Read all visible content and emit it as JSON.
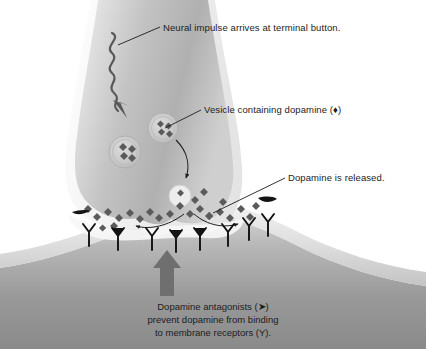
{
  "figure": {
    "background_color": "#ffffff",
    "ink_color": "#1c1c1c"
  },
  "labels": {
    "impulse": "Neural impulse arrives at terminal button.",
    "vesicle": "Vesicle containing dopamine (♦)",
    "released": "Dopamine is released."
  },
  "caption": {
    "line1": "Dopamine antagonists (➤)",
    "line2": "prevent dopamine from binding",
    "line3": "to membrane receptors (Υ)."
  },
  "symbols": {
    "dopamine": "♦",
    "antagonist": "➤",
    "receptor": "Υ"
  },
  "structures": {
    "terminal_button": "presynaptic-terminal-button",
    "axon": "axon-shaft",
    "postsynaptic_cell": "postsynaptic-membrane-cell",
    "synaptic_cleft": "synaptic-cleft",
    "vesicle_count": 2,
    "vesicle_dopamine_each": 4,
    "receptor_count": 8,
    "antagonist_count": 5
  },
  "colors": {
    "cytoplasm_light": "#e9e9e9",
    "cytoplasm_mid": "#c2c2c2",
    "cytoplasm_dark": "#a9a9a9",
    "membrane_halo": "#f2f2f2",
    "post_cell_light": "#c9c9c9",
    "post_cell_dark": "#8f8f8f",
    "dopamine_fill": "#5a5a5a",
    "receptor_stroke": "#111111",
    "arrow_gray": "#6f6f6f",
    "impulse_stroke": "#595959"
  }
}
